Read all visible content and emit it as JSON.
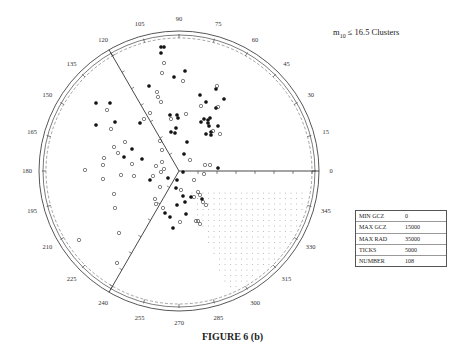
{
  "chart_data": {
    "type": "scatter",
    "subtype": "polar-wedge",
    "title": "m10 ≤ 16.5 Clusters",
    "title_parts": {
      "m": "m",
      "sub": "10",
      "rest": "≤ 16.5 Clusters"
    },
    "caption": "FIGURE 6 (b)",
    "angle_labels": [
      "0",
      "15",
      "30",
      "45",
      "60",
      "75",
      "90",
      "105",
      "120",
      "135",
      "150",
      "165",
      "180",
      "195",
      "210",
      "225",
      "240",
      "255",
      "270",
      "285",
      "300",
      "315",
      "330",
      "345"
    ],
    "radial_axes_angles_deg": [
      0,
      120,
      240
    ],
    "radial_ticks": 5000,
    "shaded_region": {
      "from_deg": 270,
      "to_deg": 360,
      "pattern": "dots"
    },
    "legend": [
      {
        "key": "MIN GCZ",
        "value": "0"
      },
      {
        "key": "MAX GCZ",
        "value": "15000"
      },
      {
        "key": "MAX RAD",
        "value": "35000"
      },
      {
        "key": "TICKS",
        "value": "5000"
      },
      {
        "key": "NUMBER",
        "value": "108"
      }
    ],
    "series": [
      {
        "name": "filled",
        "marker": "filled-circle",
        "points_px": [
          [
            161,
            47
          ],
          [
            164,
            47
          ],
          [
            161,
            53
          ],
          [
            174,
            77
          ],
          [
            200,
            95
          ],
          [
            216,
            89
          ],
          [
            206,
            102
          ],
          [
            224,
            99
          ],
          [
            185,
            71
          ],
          [
            149,
            86
          ],
          [
            178,
            118
          ],
          [
            170,
            115
          ],
          [
            177,
            115
          ],
          [
            140,
            123
          ],
          [
            171,
            132
          ],
          [
            142,
            159
          ],
          [
            132,
            149
          ],
          [
            216,
            108
          ],
          [
            204,
            119
          ],
          [
            208,
            123
          ],
          [
            210,
            118
          ],
          [
            209,
            126
          ],
          [
            218,
            126
          ],
          [
            211,
            132
          ],
          [
            211,
            135
          ],
          [
            218,
            168
          ],
          [
            206,
            134
          ],
          [
            176,
            128
          ],
          [
            184,
            154
          ],
          [
            187,
            142
          ],
          [
            175,
            133
          ],
          [
            183,
            172
          ],
          [
            177,
            180
          ],
          [
            176,
            188
          ],
          [
            168,
            178
          ],
          [
            183,
            196
          ],
          [
            185,
            202
          ],
          [
            165,
            213
          ],
          [
            173,
            228
          ],
          [
            177,
            205
          ],
          [
            186,
            214
          ],
          [
            191,
            197
          ],
          [
            96,
            103
          ],
          [
            96,
            125
          ],
          [
            110,
            103
          ],
          [
            115,
            122
          ],
          [
            124,
            157
          ],
          [
            150,
            180
          ],
          [
            170,
            217
          ],
          [
            202,
            199
          ],
          [
            201,
            122
          ],
          [
            208,
            120
          ]
        ]
      },
      {
        "name": "open",
        "marker": "open-circle",
        "points_px": [
          [
            164,
            63
          ],
          [
            162,
            73
          ],
          [
            183,
            81
          ],
          [
            157,
            92
          ],
          [
            158,
            97
          ],
          [
            161,
            102
          ],
          [
            150,
            113
          ],
          [
            144,
            119
          ],
          [
            171,
            119
          ],
          [
            186,
            114
          ],
          [
            217,
            86
          ],
          [
            201,
            106
          ],
          [
            218,
            107
          ],
          [
            213,
            131
          ],
          [
            220,
            134
          ],
          [
            107,
            110
          ],
          [
            111,
            129
          ],
          [
            114,
            147
          ],
          [
            125,
            142
          ],
          [
            104,
            158
          ],
          [
            103,
            165
          ],
          [
            132,
            164
          ],
          [
            118,
            153
          ],
          [
            162,
            150
          ],
          [
            121,
            175
          ],
          [
            134,
            176
          ],
          [
            156,
            166
          ],
          [
            153,
            176
          ],
          [
            114,
            194
          ],
          [
            115,
            208
          ],
          [
            119,
            233
          ],
          [
            160,
            141
          ],
          [
            162,
            162
          ],
          [
            164,
            169
          ],
          [
            161,
            172
          ],
          [
            160,
            187
          ],
          [
            155,
            199
          ],
          [
            156,
            204
          ],
          [
            163,
            208
          ],
          [
            181,
            190
          ],
          [
            194,
            197
          ],
          [
            200,
            195
          ],
          [
            203,
            202
          ],
          [
            196,
            221
          ],
          [
            180,
            222
          ],
          [
            206,
            205
          ],
          [
            198,
            192
          ],
          [
            204,
            174
          ],
          [
            194,
            180
          ],
          [
            190,
            160
          ],
          [
            205,
            165
          ],
          [
            210,
            165
          ],
          [
            85,
            170
          ],
          [
            79,
            240
          ],
          [
            117,
            263
          ],
          [
            200,
            224
          ],
          [
            198,
            221
          ],
          [
            103,
            179
          ]
        ]
      }
    ]
  }
}
